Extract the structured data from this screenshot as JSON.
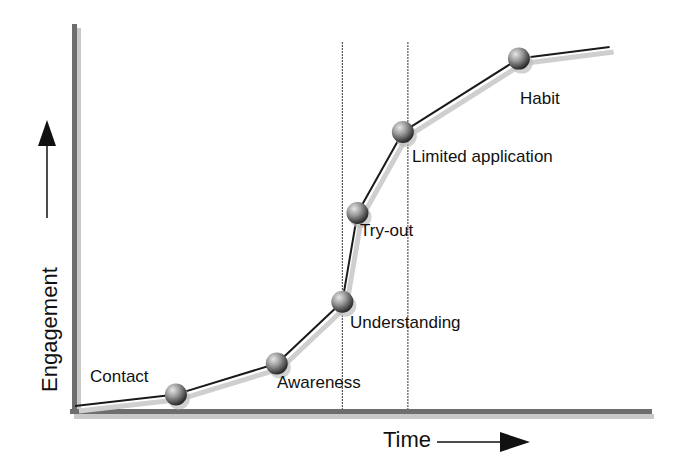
{
  "chart_data": {
    "type": "line",
    "title": "",
    "xlabel": "Time",
    "ylabel": "Engagement",
    "grid": false,
    "legend": "none",
    "stages": [
      {
        "label": "Contact",
        "time": 1.0,
        "engagement": 0.3
      },
      {
        "label": "Awareness",
        "time": 2.0,
        "engagement": 1.1
      },
      {
        "label": "Understanding",
        "time": 2.65,
        "engagement": 2.7
      },
      {
        "label": "Try-out",
        "time": 2.8,
        "engagement": 5.0
      },
      {
        "label": "Limited application",
        "time": 3.25,
        "engagement": 7.1
      },
      {
        "label": "Habit",
        "time": 4.4,
        "engagement": 9.0
      }
    ],
    "line_start": {
      "time": 0.0,
      "engagement": 0.0
    },
    "line_end": {
      "time": 5.3,
      "engagement": 9.3
    },
    "reference_lines": [
      {
        "time": 2.65,
        "style": "dashed"
      },
      {
        "time": 3.3,
        "style": "dashed"
      }
    ],
    "xlim": [
      0,
      5.7
    ],
    "ylim": [
      0,
      10
    ]
  },
  "colors": {
    "axis": "#6e6e6e",
    "line": "#1a1a1a",
    "shadow": "#cfcfcf",
    "node": "#8a8a8a",
    "text": "#111111"
  }
}
